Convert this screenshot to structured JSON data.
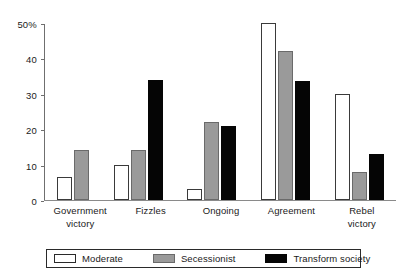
{
  "chart_data": {
    "type": "bar",
    "title": "",
    "xlabel": "",
    "ylabel": "",
    "ylim": [
      0,
      50
    ],
    "grid": false,
    "legend_position": "bottom",
    "y_ticks": [
      {
        "value": 50,
        "label": "50%"
      },
      {
        "value": 40,
        "label": "40"
      },
      {
        "value": 30,
        "label": "30"
      },
      {
        "value": 20,
        "label": "20"
      },
      {
        "value": 10,
        "label": "10"
      },
      {
        "value": 0,
        "label": "0"
      }
    ],
    "categories": [
      {
        "lines": [
          "Government",
          "victory"
        ]
      },
      {
        "lines": [
          "Fizzles"
        ]
      },
      {
        "lines": [
          "Ongoing"
        ]
      },
      {
        "lines": [
          "Agreement"
        ]
      },
      {
        "lines": [
          "Rebel",
          "victory"
        ]
      }
    ],
    "series": [
      {
        "name": "Moderate",
        "key": "moderate",
        "color": "#ffffff",
        "values": [
          6.5,
          10,
          3,
          50,
          30
        ]
      },
      {
        "name": "Secessionist",
        "key": "secessionist",
        "color": "#9a9a9a",
        "values": [
          14,
          14,
          22,
          42,
          8
        ]
      },
      {
        "name": "Transform society",
        "key": "transform",
        "color": "#050505",
        "values": [
          0,
          34,
          21,
          33.5,
          13
        ]
      }
    ]
  }
}
